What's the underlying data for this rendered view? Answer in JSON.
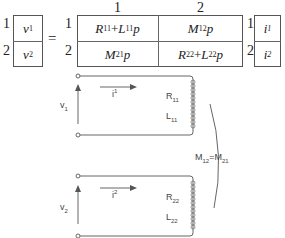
{
  "equation": {
    "lhs": {
      "row_indices": [
        "1",
        "2"
      ],
      "cells": [
        {
          "base": "v",
          "sub": "1"
        },
        {
          "base": "v",
          "sub": "2"
        }
      ]
    },
    "equals": "=",
    "matrix": {
      "col_indices": [
        "1",
        "2"
      ],
      "row_indices": [
        "1",
        "2"
      ],
      "cells": [
        [
          {
            "text1": "R",
            "sub1": "11",
            "op": "+",
            "text2": "L",
            "sub2": "11",
            "tail": "p"
          },
          {
            "text1": "M",
            "sub1": "12",
            "tail": "p"
          }
        ],
        [
          {
            "text1": "M",
            "sub1": "21",
            "tail": "p"
          },
          {
            "text1": "R",
            "sub1": "22",
            "op": "+",
            "text2": "L",
            "sub2": "22",
            "tail": "p"
          }
        ]
      ]
    },
    "rhs": {
      "row_indices": [
        "1",
        "2"
      ],
      "cells": [
        {
          "base": "i",
          "sup": "1"
        },
        {
          "base": "i",
          "sup": "2"
        }
      ]
    }
  },
  "circuit": {
    "loop1": {
      "voltage": {
        "base": "v",
        "sub": "1"
      },
      "current": {
        "base": "i",
        "sup": "1"
      },
      "resistance": {
        "base": "R",
        "sub": "11"
      },
      "inductance": {
        "base": "L",
        "sub": "11"
      }
    },
    "loop2": {
      "voltage": {
        "base": "v",
        "sub": "2"
      },
      "current": {
        "base": "i",
        "sup": "2"
      },
      "resistance": {
        "base": "R",
        "sub": "22"
      },
      "inductance": {
        "base": "L",
        "sub": "22"
      }
    },
    "mutual": {
      "left": "M",
      "left_sub": "12",
      "eq": "=",
      "right": "M",
      "right_sub": "21"
    }
  }
}
